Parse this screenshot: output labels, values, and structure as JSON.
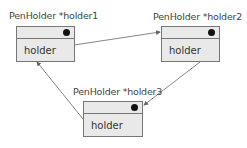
{
  "nodes": [
    {
      "id": "holder1",
      "title": "PenHolder *holder1",
      "field": "holder"
    },
    {
      "id": "holder2",
      "title": "PenHolder *holder2",
      "field": "holder"
    },
    {
      "id": "holder3",
      "title": "PenHolder *holder3",
      "field": "holder"
    }
  ],
  "edges": [
    {
      "from": "holder1",
      "to": "holder2"
    },
    {
      "from": "holder2",
      "to": "holder3"
    },
    {
      "from": "holder3",
      "to": "holder1"
    }
  ],
  "colors": {
    "box_fill": "#e9e9e9",
    "box_border": "#777777",
    "arrow": "#666666",
    "dot": "#111111"
  }
}
